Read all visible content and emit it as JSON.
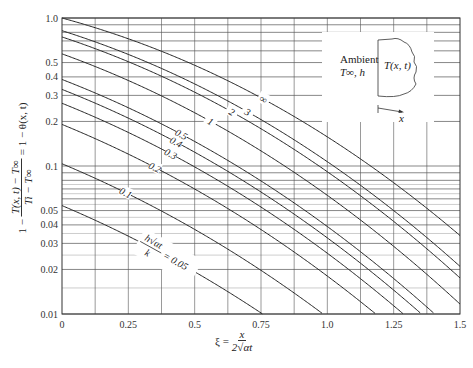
{
  "chart_data": {
    "type": "line",
    "title": "",
    "xlabel": "ξ = x / (2√(αt))",
    "ylabel": "1 − (T(x,t) − T∞)/(Ti − T∞) = 1 − θ(x,t)",
    "xlim": [
      0,
      1.5
    ],
    "ylim": [
      0.01,
      1.0
    ],
    "yscale": "log",
    "grid": true,
    "x_ticks": [
      "0",
      "0.25",
      "0.5",
      "0.75",
      "1.0",
      "1.25",
      "1.5"
    ],
    "x_tick_values": [
      0,
      0.25,
      0.5,
      0.75,
      1.0,
      1.25,
      1.5
    ],
    "y_ticks": [
      "0.01",
      "0.02",
      "0.03",
      "0.04",
      "0.05",
      "0.1",
      "0.2",
      "0.3",
      "0.4",
      "0.5",
      "1.0"
    ],
    "y_tick_values": [
      0.01,
      0.02,
      0.03,
      0.04,
      0.05,
      0.1,
      0.2,
      0.3,
      0.4,
      0.5,
      1.0
    ],
    "parameter_name": "h√(αt)/k",
    "series": [
      {
        "name": "0.05",
        "H": 0.05,
        "values_at_xi0": 0.054
      },
      {
        "name": "0.1",
        "H": 0.1,
        "values_at_xi0": 0.105
      },
      {
        "name": "0.2",
        "H": 0.2,
        "values_at_xi0": 0.198
      },
      {
        "name": "0.3",
        "H": 0.3,
        "values_at_xi0": 0.28
      },
      {
        "name": "0.4",
        "H": 0.4,
        "values_at_xi0": 0.35
      },
      {
        "name": "0.5",
        "H": 0.5,
        "values_at_xi0": 0.41
      },
      {
        "name": "1",
        "H": 1,
        "values_at_xi0": 0.57
      },
      {
        "name": "2",
        "H": 2,
        "values_at_xi0": 0.74
      },
      {
        "name": "3",
        "H": 3,
        "values_at_xi0": 0.82
      },
      {
        "name": "∞",
        "H": "inf",
        "values_at_xi0": 1.0
      }
    ],
    "curve_labels": [
      {
        "text": "h√αt / k = 0.05",
        "x": 0.4,
        "series": "0.05"
      },
      {
        "text": "0.1",
        "x": 0.24,
        "series": "0.1"
      },
      {
        "text": "0.2",
        "x": 0.35,
        "series": "0.2"
      },
      {
        "text": "0.3",
        "x": 0.41,
        "series": "0.3"
      },
      {
        "text": "0.4",
        "x": 0.43,
        "series": "0.4"
      },
      {
        "text": "0.5",
        "x": 0.45,
        "series": "0.5"
      },
      {
        "text": "1",
        "x": 0.56,
        "series": "1"
      },
      {
        "text": "2",
        "x": 0.64,
        "series": "2"
      },
      {
        "text": "3",
        "x": 0.7,
        "series": "3"
      },
      {
        "text": "∞",
        "x": 0.76,
        "series": "∞"
      }
    ]
  },
  "labels": {
    "xlabel_lhs": "ξ =",
    "xlabel_num": "x",
    "xlabel_den": "2√αt",
    "ylabel_prefix": "1 −",
    "ylabel_num": "T(x, t) − T∞",
    "ylabel_den": "Ti − T∞",
    "ylabel_suffix": "= 1 − θ(x, t)",
    "param_num": "h√αt",
    "param_den": "k",
    "param_eq": "= 0.05"
  },
  "inset": {
    "ambient": "Ambient",
    "ambient_cond": "T∞, h",
    "body_label": "T(x, t)",
    "axis_label": "x"
  },
  "colors": {
    "curve": "#222222",
    "grid_major": "#555555",
    "grid_minor": "#9a9a9a",
    "axis": "#333333"
  }
}
